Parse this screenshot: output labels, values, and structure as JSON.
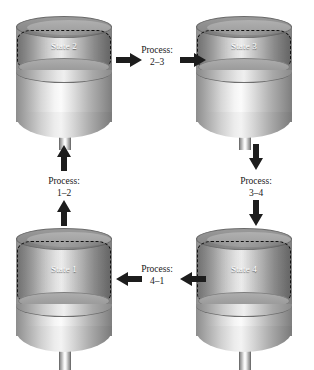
{
  "diagram": {
    "background_color": "#ffffff",
    "label_color": "#1a1a1a",
    "state_label_color": "#ffffff",
    "arrow_color": "#1d1d1d",
    "gas_boundary_style": "dashed"
  },
  "states": [
    {
      "id": "state-2",
      "label": "State 2",
      "position": "top-left",
      "piston_position": "high",
      "gas_volume": "small"
    },
    {
      "id": "state-3",
      "label": "State 3",
      "position": "top-right",
      "piston_position": "high",
      "gas_volume": "small"
    },
    {
      "id": "state-1",
      "label": "State 1",
      "position": "bottom-left",
      "piston_position": "low",
      "gas_volume": "large"
    },
    {
      "id": "state-4",
      "label": "State 4",
      "position": "bottom-right",
      "piston_position": "low",
      "gas_volume": "large"
    }
  ],
  "processes": [
    {
      "id": "process-2-3",
      "caption_line1": "Process:",
      "caption_line2": "2–3",
      "from": "State 2",
      "to": "State 3",
      "direction": "right",
      "arrow_icon": "arrow-right-icon"
    },
    {
      "id": "process-3-4",
      "caption_line1": "Process:",
      "caption_line2": "3–4",
      "from": "State 3",
      "to": "State 4",
      "direction": "down",
      "arrow_icon": "arrow-down-icon"
    },
    {
      "id": "process-4-1",
      "caption_line1": "Process:",
      "caption_line2": "4–1",
      "from": "State 4",
      "to": "State 1",
      "direction": "left",
      "arrow_icon": "arrow-left-icon"
    },
    {
      "id": "process-1-2",
      "caption_line1": "Process:",
      "caption_line2": "1–2",
      "from": "State 1",
      "to": "State 2",
      "direction": "up",
      "arrow_icon": "arrow-up-icon"
    }
  ]
}
